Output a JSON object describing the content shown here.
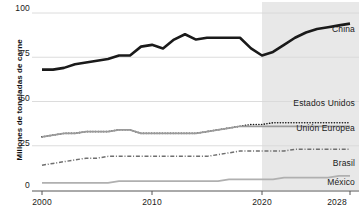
{
  "chart_data": {
    "type": "line",
    "title": "",
    "xlabel": "",
    "ylabel": "Millones de toneladas de carne",
    "xlim": [
      2000,
      2028
    ],
    "ylim": [
      0,
      100
    ],
    "yticks": [
      "0",
      "25",
      "50",
      "75",
      "100"
    ],
    "ytick_values": [
      0,
      25,
      50,
      75,
      100
    ],
    "xticks": [
      "2000",
      "2010",
      "2020",
      "2028"
    ],
    "xtick_values": [
      2000,
      2010,
      2020,
      2028
    ],
    "grid": "horizontal",
    "legend_position": "inline-right",
    "projection_start": 2020,
    "projection_shading": "#e8e8e8",
    "x": [
      2000,
      2001,
      2002,
      2003,
      2004,
      2005,
      2006,
      2007,
      2008,
      2009,
      2010,
      2011,
      2012,
      2013,
      2014,
      2015,
      2016,
      2017,
      2018,
      2019,
      2020,
      2021,
      2022,
      2023,
      2024,
      2025,
      2026,
      2027,
      2028
    ],
    "series": [
      {
        "name": "China",
        "color": "#1a1a1a",
        "style": "solid",
        "width": 2.6,
        "values": [
          68,
          68,
          69,
          71,
          72,
          73,
          74,
          76,
          76,
          81,
          82,
          80,
          85,
          88,
          85,
          86,
          86,
          86,
          86,
          80,
          76,
          78,
          82,
          86,
          89,
          91,
          92,
          93,
          94
        ]
      },
      {
        "name": "Estados Unidos",
        "color": "#1a1a1a",
        "style": "dotted",
        "width": 1.6,
        "values": [
          30,
          31,
          32,
          32,
          33,
          33,
          33,
          34,
          34,
          32,
          32,
          32,
          32,
          32,
          32,
          33,
          34,
          35,
          36,
          37,
          37,
          38,
          38,
          38,
          38,
          38,
          38,
          38,
          38
        ]
      },
      {
        "name": "Unión Europea",
        "color": "#9a9a9a",
        "style": "solid",
        "width": 1.7,
        "values": [
          30,
          31,
          32,
          32,
          33,
          33,
          33,
          34,
          34,
          32,
          32,
          32,
          32,
          32,
          32,
          33,
          34,
          35,
          36,
          36,
          36,
          36,
          36,
          36,
          36,
          36,
          36,
          36,
          36
        ]
      },
      {
        "name": "Brasil",
        "color": "#6f6f6f",
        "style": "dashdot",
        "width": 1.5,
        "values": [
          14,
          15,
          16,
          17,
          18,
          18,
          19,
          19,
          19,
          19,
          19,
          19,
          19,
          19,
          19,
          19,
          20,
          21,
          22,
          22,
          22,
          22,
          22,
          23,
          23,
          23,
          23,
          23,
          23
        ]
      },
      {
        "name": "México",
        "color": "#b0b0b0",
        "style": "solid",
        "width": 1.9,
        "values": [
          4,
          4,
          4,
          4,
          4,
          4,
          4,
          5,
          5,
          5,
          5,
          5,
          5,
          5,
          5,
          5,
          5,
          6,
          6,
          6,
          6,
          6,
          7,
          7,
          7,
          7,
          7,
          8,
          8
        ]
      }
    ]
  },
  "axis": {
    "y_title": "Millones de toneladas de carne",
    "y_labels": {
      "t100": "100",
      "t75": "75",
      "t50": "50",
      "t25": "25",
      "t0": "0"
    },
    "x_labels": {
      "x2000": "2000",
      "x2010": "2010",
      "x2020": "2020",
      "x2028": "2028"
    }
  },
  "labels": {
    "china": "China",
    "estados_unidos": "Estados Unidos",
    "union_europea": "Unión Europea",
    "brasil": "Brasil",
    "mexico": "México"
  },
  "colors": {
    "china": "#1a1a1a",
    "estados_unidos": "#1a1a1a",
    "union_europea": "#9a9a9a",
    "brasil": "#6f6f6f",
    "mexico": "#b0b0b0",
    "gridline": "#d8d8d8",
    "axis": "#555555",
    "forecast_band": "#e8e8e8"
  }
}
